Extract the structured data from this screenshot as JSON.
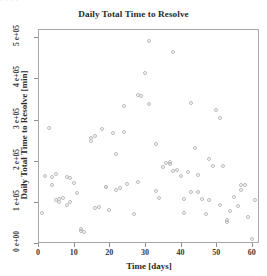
{
  "figure": {
    "top_artifact_text": "·       ·                   ·                                              ·"
  },
  "chart_data": {
    "type": "scatter",
    "title": "Daily Total Time to Resolve",
    "xlabel": "Time [days]",
    "ylabel": "Daily Total Time to Resolve [min]",
    "xlim": [
      0,
      62
    ],
    "ylim": [
      0,
      520000
    ],
    "grid": false,
    "legend": null,
    "marker": "open-circle",
    "marker_color": "#b9b9b9",
    "xticks": [
      0,
      10,
      20,
      30,
      40,
      50,
      60
    ],
    "xticklabels": [
      "0",
      "10",
      "20",
      "30",
      "40",
      "50",
      "60"
    ],
    "yticks": [
      0,
      100000,
      200000,
      300000,
      400000,
      500000
    ],
    "yticklabels": [
      "0 e+00",
      "1 e+05",
      "2 e+05",
      "3 e+05",
      "4 e+05",
      "5 e+05"
    ],
    "x": [
      1,
      2,
      3,
      4,
      4,
      5,
      5,
      6,
      6,
      7,
      8,
      8,
      9,
      9,
      10,
      11,
      12,
      12,
      13,
      15,
      15,
      16,
      16,
      17,
      18,
      19,
      19,
      20,
      21,
      22,
      22,
      23,
      24,
      24,
      25,
      27,
      28,
      28,
      29,
      30,
      31,
      31,
      33,
      33,
      34,
      35,
      36,
      37,
      37,
      38,
      38,
      39,
      40,
      41,
      41,
      42,
      43,
      43,
      44,
      45,
      45,
      46,
      47,
      48,
      48,
      49,
      50,
      51,
      51,
      52,
      53,
      53,
      54,
      55,
      56,
      57,
      57,
      58,
      59,
      60,
      61
    ],
    "y": [
      72000,
      163000,
      280000,
      160000,
      140000,
      168000,
      104000,
      108000,
      100000,
      110000,
      160000,
      93000,
      158000,
      100000,
      147000,
      122000,
      35000,
      30000,
      27000,
      249000,
      255000,
      260000,
      86000,
      88000,
      278000,
      135000,
      137000,
      80000,
      267000,
      216000,
      130000,
      133000,
      334000,
      270000,
      144000,
      71000,
      148000,
      360000,
      358000,
      414000,
      490000,
      337000,
      240000,
      126000,
      109000,
      184000,
      194000,
      196000,
      191000,
      463000,
      176000,
      178000,
      163000,
      73000,
      106000,
      173000,
      340000,
      124000,
      232000,
      165000,
      124000,
      107000,
      71000,
      104000,
      203000,
      187000,
      322000,
      304000,
      92000,
      188000,
      55000,
      52000,
      77000,
      113000,
      90000,
      129000,
      140000,
      142000,
      64000,
      10000,
      104000
    ]
  }
}
